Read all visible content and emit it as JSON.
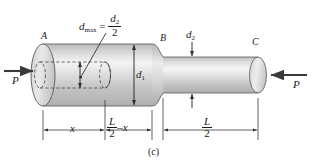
{
  "figure": {
    "caption": "(c)",
    "type": "stepped-shaft-compression-diagram"
  },
  "points": [
    {
      "id": "A",
      "label": "A"
    },
    {
      "id": "B",
      "label": "B"
    },
    {
      "id": "C",
      "label": "C"
    }
  ],
  "forces": [
    {
      "id": "left",
      "label": "P",
      "direction": "right"
    },
    {
      "id": "right",
      "label": "P",
      "direction": "left"
    }
  ],
  "diameters": {
    "d1": {
      "label": "d",
      "sub": "1"
    },
    "d2": {
      "label": "d",
      "sub": "2"
    }
  },
  "hole": {
    "label": "d",
    "sub": "max",
    "equals": "=",
    "value_num": "d",
    "value_num_sub": "2",
    "value_den": "2"
  },
  "dimensions": [
    {
      "id": "left-x",
      "label": "x"
    },
    {
      "id": "mid",
      "label_frac_num": "L",
      "label_frac_den": "2",
      "minus": "–",
      "label_tail": "x"
    },
    {
      "id": "right-half",
      "label_frac_num": "L",
      "label_frac_den": "2"
    }
  ],
  "colors": {
    "ink": "#1a1a1a",
    "body_light": "#f2f2f2",
    "body_mid": "#c9c9c9",
    "body_dark": "#a8a8a8",
    "outline": "#4a4a4a",
    "background": "#ffffff"
  }
}
